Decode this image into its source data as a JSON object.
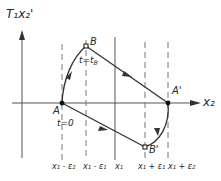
{
  "diagram": {
    "y_axis_label": "T₁x₂'",
    "x_axis_label": "x₂",
    "points": {
      "A": {
        "label": "A",
        "annotation": "t=0"
      },
      "B": {
        "label": "B",
        "annotation": "t=t_B"
      },
      "A_prime": {
        "label": "A'"
      },
      "B_prime": {
        "label": "B'"
      }
    },
    "x_ticks": [
      {
        "id": "x1_minus_e2",
        "label": "x₁ - ε₂",
        "style": "dashed"
      },
      {
        "id": "x1_minus_e1",
        "label": "x₁ - ε₁",
        "style": "dashed"
      },
      {
        "id": "x1",
        "label": "x₁",
        "style": "solid"
      },
      {
        "id": "x1_plus_e1",
        "label": "x₁ + ε₁",
        "style": "dashed"
      },
      {
        "id": "x1_plus_e2",
        "label": "x₁ + ε₂",
        "style": "dashed"
      }
    ],
    "annotations": {
      "t_zero": "t=0",
      "t_b": "t=t",
      "t_b_sub": "B"
    },
    "colors": {
      "line": "#333333",
      "axis": "#555555",
      "dashed": "#777777",
      "background": "#ffffff"
    }
  }
}
